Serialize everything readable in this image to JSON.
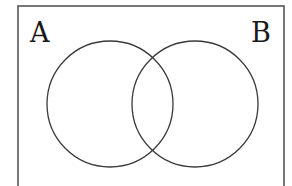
{
  "diagram": {
    "type": "venn",
    "universe": {
      "x": 18,
      "y": 6,
      "width": 266,
      "height": 190,
      "stroke": "#555555"
    },
    "sets": [
      {
        "label": "A",
        "cx": 110,
        "cy": 104,
        "r": 63,
        "label_x": 30,
        "label_y": 42
      },
      {
        "label": "B",
        "cx": 195,
        "cy": 104,
        "r": 63,
        "label_x": 251,
        "label_y": 42
      }
    ],
    "circle_stroke": "#3a3a3a"
  }
}
